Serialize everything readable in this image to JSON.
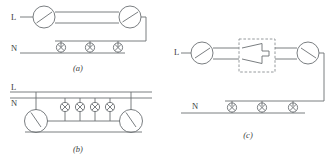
{
  "figure": {
    "background_color": "#ffffff",
    "line_color": "#6b6f73",
    "text_color": "#3b3d40"
  },
  "diagrams": [
    {
      "id": "a",
      "caption": "(a)",
      "description": "Two two-way switches controlling three lamps wired in parallel",
      "labels": {
        "live": "L",
        "neutral": "N"
      },
      "switch_count": 2,
      "switch_type": "two-way-switch",
      "lamp_count": 3,
      "lamp_symbol": "circle-with-cross",
      "traveller_wires": 2
    },
    {
      "id": "b",
      "caption": "(b)",
      "description": "Two two-way switches below the busbars controlling four lamps in parallel",
      "labels": {
        "live": "L",
        "neutral": "N"
      },
      "switch_count": 2,
      "switch_type": "two-way-switch",
      "lamp_count": 4,
      "lamp_symbol": "circle-with-cross",
      "traveller_wires": 2
    },
    {
      "id": "c",
      "caption": "(c)",
      "description": "Two two-way switches with an intermediate (crossover) switch controlling three lamps in parallel",
      "labels": {
        "live": "L",
        "neutral": "N"
      },
      "switch_count": 2,
      "switch_type": "two-way-switch",
      "intermediate_switch": {
        "present": true,
        "enclosure": "dashed-box",
        "symbol": "crossover-contacts"
      },
      "lamp_count": 3,
      "lamp_symbol": "circle-with-cross",
      "traveller_wires": 2
    }
  ]
}
